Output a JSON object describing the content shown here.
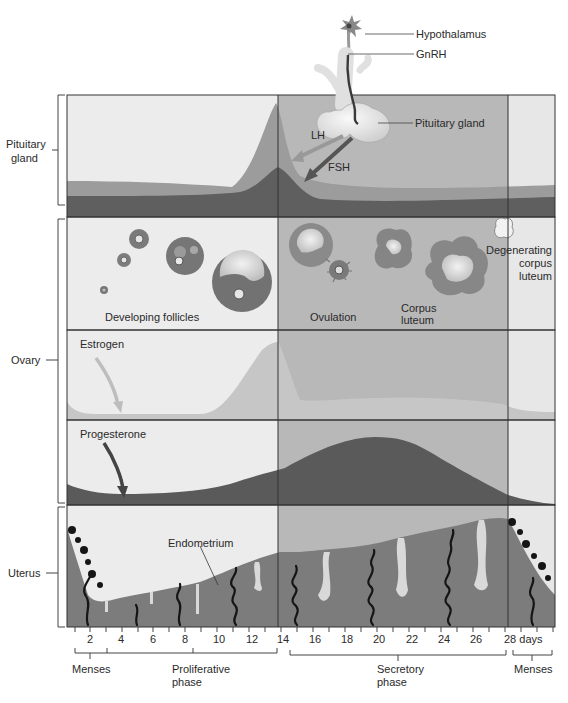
{
  "diagram": {
    "colors": {
      "pre_ovulation_bg": "#ebebeb",
      "post_ovulation_bg": "#b9b9b9",
      "menses_bg": "#e6e6e6",
      "lh_curve": "#9a9a9a",
      "fsh_curve": "#5e5e5e",
      "estrogen_fill": "#c6c6c6",
      "progesterone_fill": "#5a5a5a",
      "endometrium": "#7a7a7a",
      "spiral_arteries": "#111111",
      "border": "#333333"
    },
    "top_labels": {
      "hypothalamus": "Hypothalamus",
      "gnrh": "GnRH",
      "pituitary_gland": "Pituitary gland",
      "lh": "LH",
      "fsh": "FSH"
    },
    "row_labels": {
      "pituitary_line1": "Pituitary",
      "pituitary_line2": "gland",
      "ovary": "Ovary",
      "uterus": "Uterus"
    },
    "ovary_panel": {
      "developing_follicles": "Developing follicles",
      "ovulation": "Ovulation",
      "corpus_luteum_line1": "Corpus",
      "corpus_luteum_line2": "luteum",
      "degenerating_line1": "Degenerating",
      "degenerating_line2": "corpus",
      "degenerating_line3": "luteum"
    },
    "hormone_panels": {
      "estrogen": "Estrogen",
      "progesterone": "Progesterone"
    },
    "uterus_panel": {
      "endometrium": "Endometrium"
    },
    "day_axis": {
      "ticks": [
        "2",
        "4",
        "6",
        "8",
        "10",
        "12",
        "14",
        "16",
        "18",
        "20",
        "22",
        "24",
        "26",
        "28 days"
      ]
    },
    "phases": {
      "menses_start": "Menses",
      "proliferative_line1": "Proliferative",
      "proliferative_line2": "phase",
      "secretory_line1": "Secretory",
      "secretory_line2": "phase",
      "menses_end": "Menses"
    }
  }
}
